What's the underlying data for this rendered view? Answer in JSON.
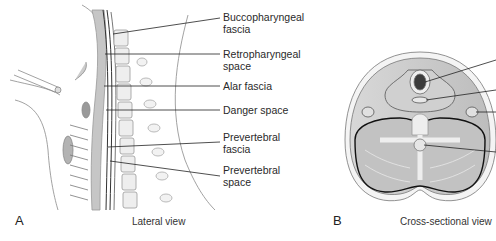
{
  "panels": [
    {
      "letter": "A",
      "caption": "Lateral view",
      "labels": [
        {
          "text": "Buccopharyngeal\nfascia"
        },
        {
          "text": "Retropharyngeal\nspace"
        },
        {
          "text": "Alar fascia"
        },
        {
          "text": "Danger space"
        },
        {
          "text": "Prevertebral\nfascia"
        },
        {
          "text": "Prevertebral\nspace"
        }
      ]
    },
    {
      "letter": "B",
      "caption": "Cross-sectional view"
    }
  ]
}
